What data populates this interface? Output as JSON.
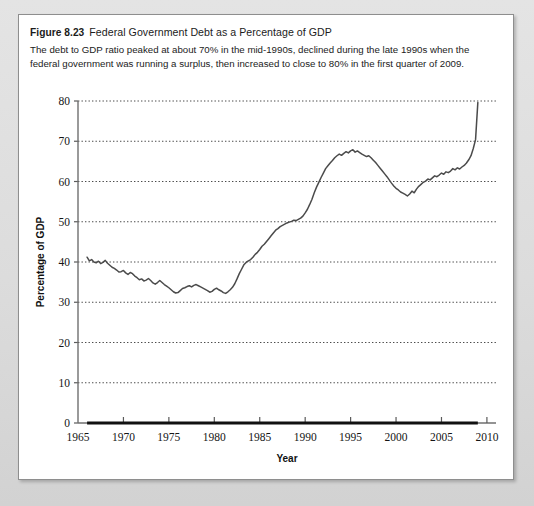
{
  "figure": {
    "number": "Figure 8.23",
    "title": "Federal Government Debt as a Percentage of GDP",
    "caption": "The debt to GDP ratio peaked at about 70% in the mid-1990s, declined during the late 1990s when the federal government was running a surplus, then increased to close to 80% in the first quarter of 2009."
  },
  "chart_data": {
    "type": "line",
    "title": "Federal Government Debt as a Percentage of GDP",
    "xlabel": "Year",
    "ylabel": "Percentage of GDP",
    "xlim": [
      1965,
      2011
    ],
    "ylim": [
      0,
      80
    ],
    "grid": true,
    "legend": null,
    "y_ticks": [
      0,
      10,
      20,
      30,
      40,
      50,
      60,
      70,
      80
    ],
    "x_ticks": [
      1965,
      1970,
      1975,
      1980,
      1985,
      1990,
      1995,
      2000,
      2005,
      2010
    ],
    "x_tick_labels": [
      "1965",
      "1970",
      "1975",
      "1980",
      "1985",
      "1990",
      "1995",
      "2000",
      "2005",
      "2010"
    ],
    "y_tick_labels": [
      "0",
      "10",
      "20",
      "30",
      "40",
      "50",
      "60",
      "70",
      "80"
    ],
    "series": [
      {
        "name": "Federal debt as percentage of GDP",
        "color": "#4b4b4b",
        "x": [
          1966.0,
          1966.25,
          1966.5,
          1966.75,
          1967.0,
          1967.25,
          1967.5,
          1967.75,
          1968.0,
          1968.25,
          1968.5,
          1968.75,
          1969.0,
          1969.25,
          1969.5,
          1969.75,
          1970.0,
          1970.25,
          1970.5,
          1970.75,
          1971.0,
          1971.25,
          1971.5,
          1971.75,
          1972.0,
          1972.25,
          1972.5,
          1972.75,
          1973.0,
          1973.25,
          1973.5,
          1973.75,
          1974.0,
          1974.25,
          1974.5,
          1974.75,
          1975.0,
          1975.25,
          1975.5,
          1975.75,
          1976.0,
          1976.25,
          1976.5,
          1976.75,
          1977.0,
          1977.25,
          1977.5,
          1977.75,
          1978.0,
          1978.25,
          1978.5,
          1978.75,
          1979.0,
          1979.25,
          1979.5,
          1979.75,
          1980.0,
          1980.25,
          1980.5,
          1980.75,
          1981.0,
          1981.25,
          1981.5,
          1981.75,
          1982.0,
          1982.25,
          1982.5,
          1982.75,
          1983.0,
          1983.25,
          1983.5,
          1983.75,
          1984.0,
          1984.25,
          1984.5,
          1984.75,
          1985.0,
          1985.25,
          1985.5,
          1985.75,
          1986.0,
          1986.25,
          1986.5,
          1986.75,
          1987.0,
          1987.25,
          1987.5,
          1987.75,
          1988.0,
          1988.25,
          1988.5,
          1988.75,
          1989.0,
          1989.25,
          1989.5,
          1989.75,
          1990.0,
          1990.25,
          1990.5,
          1990.75,
          1991.0,
          1991.25,
          1991.5,
          1991.75,
          1992.0,
          1992.25,
          1992.5,
          1992.75,
          1993.0,
          1993.25,
          1993.5,
          1993.75,
          1994.0,
          1994.25,
          1994.5,
          1994.75,
          1995.0,
          1995.25,
          1995.5,
          1995.75,
          1996.0,
          1996.25,
          1996.5,
          1996.75,
          1997.0,
          1997.25,
          1997.5,
          1997.75,
          1998.0,
          1998.25,
          1998.5,
          1998.75,
          1999.0,
          1999.25,
          1999.5,
          1999.75,
          2000.0,
          2000.25,
          2000.5,
          2000.75,
          2001.0,
          2001.25,
          2001.5,
          2001.75,
          2002.0,
          2002.25,
          2002.5,
          2002.75,
          2003.0,
          2003.25,
          2003.5,
          2003.75,
          2004.0,
          2004.25,
          2004.5,
          2004.75,
          2005.0,
          2005.25,
          2005.5,
          2005.75,
          2006.0,
          2006.25,
          2006.5,
          2006.75,
          2007.0,
          2007.25,
          2007.5,
          2007.75,
          2008.0,
          2008.25,
          2008.5,
          2008.75,
          2009.0
        ],
        "y": [
          41.2,
          40.3,
          40.6,
          40.0,
          39.8,
          40.2,
          39.6,
          39.9,
          40.4,
          39.7,
          39.2,
          38.7,
          38.4,
          38.0,
          37.5,
          37.6,
          37.9,
          37.3,
          36.9,
          37.4,
          37.1,
          36.5,
          36.1,
          35.6,
          35.8,
          35.3,
          35.5,
          35.9,
          35.4,
          34.8,
          34.5,
          34.9,
          35.4,
          34.9,
          34.4,
          34.0,
          33.6,
          33.1,
          32.6,
          32.3,
          32.4,
          32.9,
          33.4,
          33.6,
          33.9,
          34.1,
          33.8,
          34.2,
          34.4,
          34.1,
          33.8,
          33.5,
          33.2,
          32.9,
          32.5,
          32.7,
          33.2,
          33.5,
          33.1,
          32.8,
          32.4,
          32.2,
          32.6,
          33.1,
          33.7,
          34.6,
          35.8,
          37.1,
          38.2,
          39.3,
          39.9,
          40.3,
          40.6,
          41.2,
          41.9,
          42.4,
          43.1,
          43.9,
          44.4,
          45.1,
          45.8,
          46.5,
          47.2,
          47.9,
          48.3,
          48.8,
          49.1,
          49.4,
          49.7,
          49.9,
          50.1,
          50.4,
          50.3,
          50.6,
          50.9,
          51.4,
          52.2,
          53.1,
          54.3,
          55.6,
          57.2,
          58.6,
          59.8,
          61.0,
          62.1,
          63.2,
          63.9,
          64.6,
          65.2,
          65.9,
          66.4,
          66.8,
          66.5,
          67.0,
          67.4,
          67.1,
          67.6,
          67.9,
          67.3,
          67.6,
          67.2,
          66.8,
          66.5,
          66.2,
          66.4,
          65.9,
          65.3,
          64.7,
          64.0,
          63.3,
          62.6,
          61.9,
          61.2,
          60.4,
          59.6,
          58.9,
          58.3,
          57.9,
          57.4,
          57.1,
          56.8,
          56.4,
          56.9,
          57.6,
          57.2,
          58.1,
          58.8,
          59.3,
          59.8,
          60.1,
          60.6,
          60.4,
          60.9,
          61.4,
          61.2,
          61.6,
          62.1,
          61.8,
          62.4,
          62.2,
          62.6,
          63.2,
          62.9,
          63.4,
          63.1,
          63.6,
          64.0,
          64.6,
          65.4,
          66.4,
          68.2,
          70.4,
          79.6
        ]
      }
    ],
    "annotations": [
      {
        "text": "peak about 70% in the mid-1990s"
      },
      {
        "text": "close to 80% in the first quarter of 2009"
      }
    ]
  }
}
